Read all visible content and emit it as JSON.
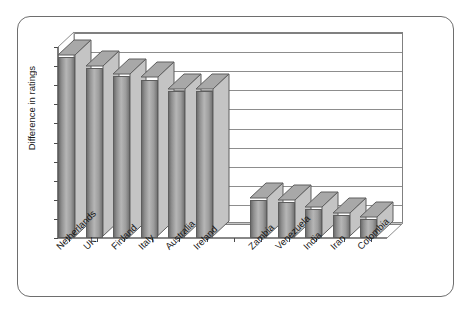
{
  "chart_data": {
    "type": "bar",
    "title": "",
    "subtitle": "",
    "xlabel": "",
    "ylabel": "Difference in ratings",
    "ylim": [
      1.3,
      2.3
    ],
    "ytick_labels": [
      "2.3",
      "2.2",
      "2.1",
      "2",
      "1.9",
      "1.8",
      "1.7",
      "1.6",
      "1.5",
      "1.4",
      "1.3"
    ],
    "ytick_values": [
      2.3,
      2.2,
      2.1,
      2.0,
      1.9,
      1.8,
      1.7,
      1.6,
      1.5,
      1.4,
      1.3
    ],
    "grid": true,
    "legend": "none",
    "style_3d": true,
    "categories": [
      "Netherlands",
      "UK",
      "Finland",
      "Italy",
      "Australia",
      "Ireland",
      "",
      "Zambia",
      "Venezuela",
      "India",
      "Iran",
      "Colombia"
    ],
    "values": [
      2.25,
      2.19,
      2.15,
      2.13,
      2.07,
      2.07,
      null,
      1.5,
      1.49,
      1.45,
      1.42,
      1.4
    ],
    "bars": [
      {
        "label": "Netherlands",
        "value": 2.25
      },
      {
        "label": "UK",
        "value": 2.19
      },
      {
        "label": "Finland",
        "value": 2.15
      },
      {
        "label": "Italy",
        "value": 2.13
      },
      {
        "label": "Australia",
        "value": 2.07
      },
      {
        "label": "Ireland",
        "value": 2.07
      },
      {
        "label": "",
        "value": null
      },
      {
        "label": "Zambia",
        "value": 1.5
      },
      {
        "label": "Venezuela",
        "value": 1.49
      },
      {
        "label": "India",
        "value": 1.45
      },
      {
        "label": "Iran",
        "value": 1.42
      },
      {
        "label": "Colombia",
        "value": 1.4
      }
    ],
    "colors": {
      "bar_face_light": "#b6b6b6",
      "bar_face_dark": "#6e6e6e",
      "bar_outline": "#5e5e5e",
      "gridline": "#8d8d8d",
      "axis": "#4a4a4a",
      "frame": "#6e6e6e",
      "background": "#ffffff",
      "text": "#161616"
    }
  },
  "axis": {
    "y_title": "Difference in ratings",
    "y_ticks": [
      "2.3",
      "2.2",
      "2.1",
      "2",
      "1.9",
      "1.8",
      "1.7",
      "1.6",
      "1.5",
      "1.4",
      "1.3"
    ],
    "x_labels": [
      "Netherlands",
      "UK",
      "Finland",
      "Italy",
      "Australia",
      "Ireland",
      "Zambia",
      "Venezuela",
      "India",
      "Iran",
      "Colombia"
    ]
  }
}
